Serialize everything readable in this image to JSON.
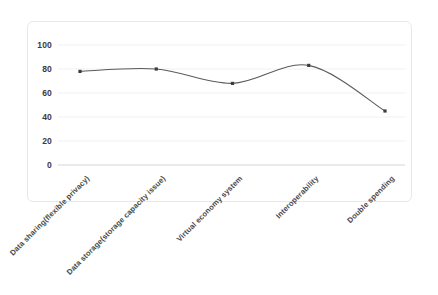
{
  "chart_data": {
    "type": "line",
    "title": "",
    "subtitle": "",
    "xlabel": "",
    "ylabel": "",
    "categories": [
      "Data sharing(flexible privacy)",
      "Data storage(storage capacity issue)",
      "Virtual economy system",
      "Interoperability",
      "Double spending"
    ],
    "values": [
      78,
      80,
      68,
      83,
      45
    ],
    "ylim": [
      0,
      100
    ],
    "yticks": [
      0,
      20,
      40,
      60,
      80,
      100
    ],
    "ytick_labels": [
      "0",
      "20",
      "40",
      "60",
      "80",
      "100"
    ],
    "grid": true,
    "grid_axis": "y",
    "legend": false,
    "legend_position": "none",
    "smooth": true,
    "markers": true,
    "series": [
      {
        "name": "Series 1",
        "values": [
          78,
          80,
          68,
          83,
          45
        ]
      }
    ],
    "colors": {
      "line": "#5a5a5a",
      "marker": "#3d3d3d",
      "grid": "#ededed",
      "axis": "#d6d6d6",
      "tick_text": "#3b3b3b",
      "card_border": "#e8e8e8",
      "background": "#ffffff"
    }
  }
}
